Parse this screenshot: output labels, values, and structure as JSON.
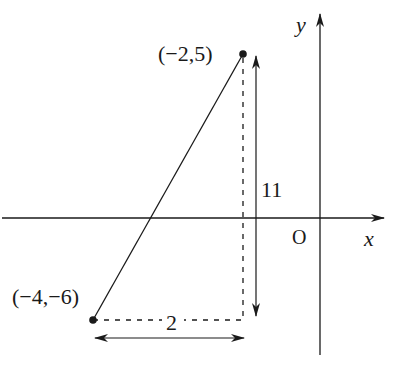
{
  "diagram": {
    "axes": {
      "x_label": "x",
      "y_label": "y",
      "origin_label": "O"
    },
    "points": [
      {
        "id": "A",
        "label": "(−2,5)",
        "x": -2,
        "y": 5
      },
      {
        "id": "B",
        "label": "(−4,−6)",
        "x": -4,
        "y": -6
      }
    ],
    "vertical_distance_label": "11",
    "horizontal_distance_label": "2",
    "colors": {
      "ink": "#1a1a1a",
      "background": "#ffffff"
    }
  }
}
